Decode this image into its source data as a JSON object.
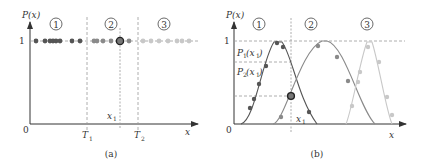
{
  "figure": {
    "panel_a": {
      "caption": "(a)",
      "y_axis_label": "P(x)",
      "x_axis_label": "x",
      "origin_label": "0",
      "y_tick_label": "1",
      "threshold_labels": [
        "T",
        "T"
      ],
      "threshold_subscripts": [
        "1",
        "2"
      ],
      "point_label": "x",
      "point_label_sub": "1",
      "region_labels": [
        "1",
        "2",
        "3"
      ]
    },
    "panel_b": {
      "caption": "(b)",
      "y_axis_label": "P(x)",
      "x_axis_label": "x",
      "origin_label": "0",
      "y_tick_label": "1",
      "point_label": "x",
      "point_label_sub": "1",
      "p1_label": "P",
      "p1_sub": "1",
      "p1_arg": "(x",
      "p1_arg_sub": "1",
      "p2_label": "P",
      "p2_sub": "2",
      "p2_arg": "(x",
      "p2_arg_sub": "1",
      "close_paren": ")",
      "region_labels": [
        "1",
        "2",
        "3"
      ]
    },
    "colors": {
      "class1": "#555555",
      "class2": "#8a8a8a",
      "class3": "#c8c8c8",
      "axis": "#333333",
      "guide": "#999999"
    }
  }
}
